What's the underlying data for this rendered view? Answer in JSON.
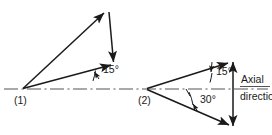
{
  "figure": {
    "background_color": "#ffffff",
    "line_color": "#1a1a1a",
    "centerline_color": "#555555",
    "text_color": "#1a1a1a"
  },
  "axis": {
    "label_line1": "Axial",
    "label_line2": "direction",
    "style": "dash-dot centerline",
    "y": 89
  },
  "diagrams": [
    {
      "id": "diagram-1",
      "vertex_label": "(1)",
      "angles": [
        {
          "id": "angle-15-left",
          "value": "15°",
          "degrees": 15,
          "measured_from": "axial direction",
          "label_x": 104,
          "label_y": 70
        }
      ],
      "vectors": [
        {
          "name": "upper-diagonal-vector",
          "from": [
            22,
            89
          ],
          "to": [
            104,
            12
          ],
          "arrow_at": "to",
          "description": "long diagonal from vertex (1) up-right"
        },
        {
          "name": "lower-diagonal-vector",
          "from": [
            22,
            89
          ],
          "to": [
            112,
            65
          ],
          "arrow_at": "to",
          "description": "shallow diagonal at 15 degrees from vertex (1)"
        },
        {
          "name": "vertical-closing-vector",
          "from": [
            108,
            12
          ],
          "to": [
            113,
            64
          ],
          "arrow_at": "to",
          "description": "vertical closing side pointing downward"
        }
      ]
    },
    {
      "id": "diagram-2",
      "vertex_label": "(2)",
      "angles": [
        {
          "id": "angle-15-right",
          "value": "15°",
          "degrees": 15,
          "measured_from": "axial direction",
          "label_x": 216,
          "label_y": 72
        },
        {
          "id": "angle-30-right",
          "value": "30°",
          "degrees": 30,
          "measured_from": "axial direction",
          "label_x": 201,
          "label_y": 100
        }
      ],
      "vectors": [
        {
          "name": "upper-diagonal-vector",
          "from": [
            146,
            89
          ],
          "to": [
            229,
            62
          ],
          "arrow_at": "to",
          "description": "diagonal from vertex (2) up-right at 15 degrees"
        },
        {
          "name": "lower-diagonal-vector",
          "from": [
            146,
            89
          ],
          "to": [
            230,
            126
          ],
          "arrow_at": "to",
          "description": "diagonal from vertex (2) down-right at 30 degrees"
        },
        {
          "name": "vertical-double-arrow-vector",
          "from": [
            233,
            60
          ],
          "to": [
            233,
            128
          ],
          "arrow_at": "both",
          "description": "vertical closing side with arrowheads top and bottom"
        }
      ]
    }
  ]
}
